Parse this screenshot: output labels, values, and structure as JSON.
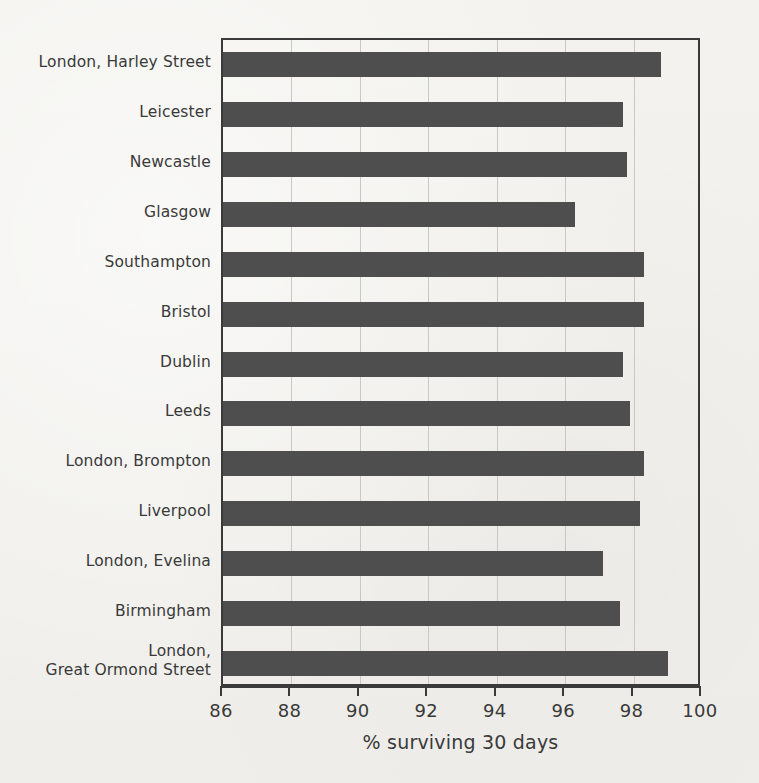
{
  "chart_data": {
    "type": "bar",
    "orientation": "horizontal",
    "title": "",
    "xlabel": "% surviving 30 days",
    "ylabel": "",
    "xlim": [
      86,
      100
    ],
    "xticks": [
      86,
      88,
      90,
      92,
      94,
      96,
      98,
      100
    ],
    "xticklabels": [
      "86",
      "88",
      "90",
      "92",
      "94",
      "96",
      "98",
      "100"
    ],
    "grid": "vertical",
    "legend": "none",
    "bar_color": "#4e4e4e",
    "background_color": "#f2f1ed",
    "axis_color": "#3a3a3a",
    "categories": [
      "London, Harley Street",
      "Leicester",
      "Newcastle",
      "Glasgow",
      "Southampton",
      "Bristol",
      "Dublin",
      "Leeds",
      "London, Brompton",
      "Liverpool",
      "London, Evelina",
      "Birmingham",
      "London, Great Ormond Street"
    ],
    "category_lines": [
      [
        "London, Harley Street"
      ],
      [
        "Leicester"
      ],
      [
        "Newcastle"
      ],
      [
        "Glasgow"
      ],
      [
        "Southampton"
      ],
      [
        "Bristol"
      ],
      [
        "Dublin"
      ],
      [
        "Leeds"
      ],
      [
        "London, Brompton"
      ],
      [
        "Liverpool"
      ],
      [
        "London, Evelina"
      ],
      [
        "Birmingham"
      ],
      [
        "London,",
        "Great Ormond Street"
      ]
    ],
    "values": [
      98.8,
      97.7,
      97.8,
      96.3,
      98.3,
      98.3,
      97.7,
      97.9,
      98.3,
      98.2,
      97.1,
      97.6,
      99.0
    ]
  },
  "figure": {
    "axis_title": "% surviving 30 days"
  }
}
